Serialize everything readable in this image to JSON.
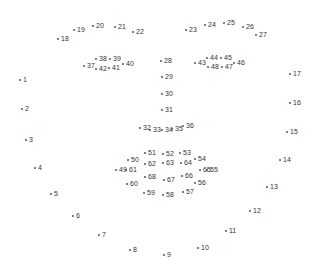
{
  "diagram": {
    "title": "",
    "type": "68-point facial landmark map",
    "marker_color": "#555555",
    "label_color": "#333333",
    "groups": {
      "jaw": [
        1,
        2,
        3,
        4,
        5,
        6,
        7,
        8,
        9,
        10,
        11,
        12,
        13,
        14,
        15,
        16,
        17
      ],
      "right_eyebrow": [
        18,
        19,
        20,
        21,
        22
      ],
      "left_eyebrow": [
        23,
        24,
        25,
        26,
        27
      ],
      "nose_bridge": [
        28,
        29,
        30,
        31
      ],
      "nose_bottom": [
        32,
        33,
        34,
        35,
        36
      ],
      "right_eye": [
        37,
        38,
        39,
        40,
        41,
        42
      ],
      "left_eye": [
        43,
        44,
        45,
        46,
        47,
        48
      ],
      "outer_lip": [
        49,
        50,
        51,
        52,
        53,
        54,
        55,
        56,
        57,
        58,
        59,
        60
      ],
      "inner_lip": [
        61,
        62,
        63,
        64,
        65,
        66,
        67,
        68
      ]
    },
    "points": [
      {
        "id": 1,
        "label": "1",
        "x": 20,
        "y": 79
      },
      {
        "id": 2,
        "label": "2",
        "x": 22,
        "y": 108
      },
      {
        "id": 3,
        "label": "3",
        "x": 26,
        "y": 139
      },
      {
        "id": 4,
        "label": "4",
        "x": 35,
        "y": 167
      },
      {
        "id": 5,
        "label": "5",
        "x": 51,
        "y": 193
      },
      {
        "id": 6,
        "label": "6",
        "x": 73,
        "y": 215
      },
      {
        "id": 7,
        "label": "7",
        "x": 99,
        "y": 234
      },
      {
        "id": 8,
        "label": "8",
        "x": 130,
        "y": 249
      },
      {
        "id": 9,
        "label": "9",
        "x": 164,
        "y": 254
      },
      {
        "id": 10,
        "label": "10",
        "x": 198,
        "y": 247
      },
      {
        "id": 11,
        "label": "11",
        "x": 226,
        "y": 230
      },
      {
        "id": 12,
        "label": "12",
        "x": 250,
        "y": 210
      },
      {
        "id": 13,
        "label": "13",
        "x": 267,
        "y": 186
      },
      {
        "id": 14,
        "label": "14",
        "x": 280,
        "y": 159
      },
      {
        "id": 15,
        "label": "15",
        "x": 287,
        "y": 131
      },
      {
        "id": 16,
        "label": "16",
        "x": 290,
        "y": 102
      },
      {
        "id": 17,
        "label": "17",
        "x": 290,
        "y": 73
      },
      {
        "id": 18,
        "label": "18",
        "x": 58,
        "y": 38
      },
      {
        "id": 19,
        "label": "19",
        "x": 74,
        "y": 29
      },
      {
        "id": 20,
        "label": "20",
        "x": 93,
        "y": 25
      },
      {
        "id": 21,
        "label": "21",
        "x": 115,
        "y": 26
      },
      {
        "id": 22,
        "label": "22",
        "x": 133,
        "y": 31
      },
      {
        "id": 23,
        "label": "23",
        "x": 186,
        "y": 29
      },
      {
        "id": 24,
        "label": "24",
        "x": 205,
        "y": 24
      },
      {
        "id": 25,
        "label": "25",
        "x": 224,
        "y": 22
      },
      {
        "id": 26,
        "label": "26",
        "x": 243,
        "y": 26
      },
      {
        "id": 27,
        "label": "27",
        "x": 256,
        "y": 34
      },
      {
        "id": 28,
        "label": "28",
        "x": 161,
        "y": 60
      },
      {
        "id": 29,
        "label": "29",
        "x": 162,
        "y": 76
      },
      {
        "id": 30,
        "label": "30",
        "x": 162,
        "y": 93
      },
      {
        "id": 31,
        "label": "31",
        "x": 162,
        "y": 109
      },
      {
        "id": 32,
        "label": "32",
        "x": 140,
        "y": 127
      },
      {
        "id": 33,
        "label": "33",
        "x": 150,
        "y": 129
      },
      {
        "id": 34,
        "label": "34",
        "x": 162,
        "y": 129
      },
      {
        "id": 35,
        "label": "35",
        "x": 172,
        "y": 128
      },
      {
        "id": 36,
        "label": "36",
        "x": 183,
        "y": 125
      },
      {
        "id": 37,
        "label": "37",
        "x": 84,
        "y": 65
      },
      {
        "id": 38,
        "label": "38",
        "x": 96,
        "y": 58
      },
      {
        "id": 39,
        "label": "39",
        "x": 110,
        "y": 58
      },
      {
        "id": 40,
        "label": "40",
        "x": 123,
        "y": 63
      },
      {
        "id": 41,
        "label": "41",
        "x": 109,
        "y": 67
      },
      {
        "id": 42,
        "label": "42",
        "x": 96,
        "y": 68
      },
      {
        "id": 43,
        "label": "43",
        "x": 195,
        "y": 62
      },
      {
        "id": 44,
        "label": "44",
        "x": 207,
        "y": 57
      },
      {
        "id": 45,
        "label": "45",
        "x": 221,
        "y": 57
      },
      {
        "id": 46,
        "label": "46",
        "x": 234,
        "y": 62
      },
      {
        "id": 47,
        "label": "47",
        "x": 222,
        "y": 66
      },
      {
        "id": 48,
        "label": "48",
        "x": 208,
        "y": 66
      },
      {
        "id": 49,
        "label": "49",
        "x": 116,
        "y": 169
      },
      {
        "id": 50,
        "label": "50",
        "x": 128,
        "y": 159
      },
      {
        "id": 51,
        "label": "51",
        "x": 145,
        "y": 152
      },
      {
        "id": 52,
        "label": "52",
        "x": 163,
        "y": 153
      },
      {
        "id": 53,
        "label": "53",
        "x": 180,
        "y": 152
      },
      {
        "id": 54,
        "label": "54",
        "x": 195,
        "y": 158
      },
      {
        "id": 55,
        "label": "55",
        "x": 207,
        "y": 169
      },
      {
        "id": 56,
        "label": "56",
        "x": 195,
        "y": 182
      },
      {
        "id": 57,
        "label": "57",
        "x": 183,
        "y": 191
      },
      {
        "id": 58,
        "label": "58",
        "x": 163,
        "y": 194
      },
      {
        "id": 59,
        "label": "59",
        "x": 144,
        "y": 192
      },
      {
        "id": 60,
        "label": "60",
        "x": 127,
        "y": 183
      },
      {
        "id": 61,
        "label": "61",
        "x": 126,
        "y": 169
      },
      {
        "id": 62,
        "label": "62",
        "x": 145,
        "y": 163
      },
      {
        "id": 63,
        "label": "63",
        "x": 163,
        "y": 162
      },
      {
        "id": 64,
        "label": "64",
        "x": 181,
        "y": 162
      },
      {
        "id": 65,
        "label": "65",
        "x": 200,
        "y": 169
      },
      {
        "id": 66,
        "label": "66",
        "x": 182,
        "y": 175
      },
      {
        "id": 67,
        "label": "67",
        "x": 164,
        "y": 179
      },
      {
        "id": 68,
        "label": "68",
        "x": 145,
        "y": 176
      }
    ]
  }
}
